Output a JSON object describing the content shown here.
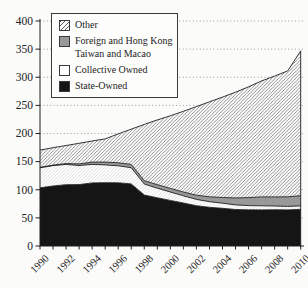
{
  "colors": {
    "state_fill": "#151515",
    "foreign_fill": "#989898",
    "other_hatch_line": "#5c5c5c",
    "collective_hatch_line": "#c9c9c9",
    "axis": "#1f1f1f",
    "grid": "#8f8f8f",
    "background": "#fbfbfa"
  },
  "legend": {
    "items": [
      {
        "key": "other",
        "label": "Other",
        "swatch": "hatch"
      },
      {
        "key": "foreign",
        "label": "Foreign and Hong Kong Taiwan and Macao",
        "swatch": "gray"
      },
      {
        "key": "collective",
        "label": "Collective Owned",
        "swatch": "white"
      },
      {
        "key": "state",
        "label": "State-Owned",
        "swatch": "black"
      }
    ]
  },
  "chart_data": {
    "type": "area",
    "stacked": true,
    "title": "",
    "xlabel": "",
    "ylabel": "",
    "xlim": [
      1990,
      2010
    ],
    "ylim": [
      0,
      400
    ],
    "grid": "dotted-horizontal",
    "legend_position": "top-left",
    "x": [
      1990,
      1991,
      1992,
      1993,
      1994,
      1995,
      1996,
      1997,
      1998,
      1999,
      2000,
      2001,
      2002,
      2003,
      2004,
      2005,
      2006,
      2007,
      2008,
      2009,
      2010
    ],
    "xticks": [
      1990,
      1992,
      1994,
      1996,
      1998,
      2000,
      2002,
      2004,
      2006,
      2008,
      2010
    ],
    "yticks": [
      0,
      50,
      100,
      150,
      200,
      250,
      300,
      350,
      400
    ],
    "series": [
      {
        "key": "state",
        "name": "State-Owned",
        "fill": "black",
        "values": [
          103.5,
          106.6,
          108.9,
          109.2,
          112.1,
          112.6,
          112.4,
          110.4,
          90.6,
          85.7,
          81.0,
          76.4,
          71.6,
          68.8,
          67.1,
          64.9,
          64.3,
          64.2,
          64.5,
          64.2,
          65.2
        ]
      },
      {
        "key": "collective",
        "name": "Collective Owned",
        "fill": "light-hatch",
        "values": [
          35.5,
          36.3,
          36.2,
          33.9,
          32.9,
          31.5,
          30.2,
          28.8,
          19.6,
          17.1,
          15.0,
          12.9,
          11.2,
          10.0,
          9.0,
          8.1,
          7.6,
          7.2,
          6.6,
          6.2,
          6.0
        ]
      },
      {
        "key": "foreign",
        "name": "Foreign and Hong Kong Taiwan and Macao",
        "fill": "gray",
        "values": [
          0.7,
          1.0,
          1.4,
          2.9,
          4.1,
          5.1,
          5.4,
          5.8,
          5.9,
          6.1,
          6.4,
          6.7,
          7.6,
          8.6,
          10.2,
          12.5,
          14.1,
          15.8,
          16.2,
          17.0,
          18.2
        ]
      },
      {
        "key": "other",
        "name": "Other",
        "fill": "hatch",
        "values": [
          30.8,
          30.8,
          32.1,
          36.6,
          37.5,
          41.2,
          51.2,
          62.7,
          100.1,
          115.2,
          129.1,
          143.4,
          157.4,
          169.0,
          178.5,
          187.9,
          197.1,
          206.3,
          214.8,
          223.8,
          257.5
        ]
      }
    ]
  }
}
